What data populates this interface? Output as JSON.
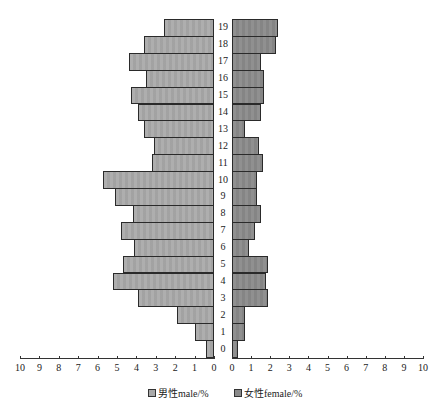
{
  "chart_data": {
    "type": "bar",
    "orientation": "horizontal",
    "subtype": "population-pyramid",
    "title": "",
    "categories": [
      "0",
      "1",
      "2",
      "3",
      "4",
      "5",
      "6",
      "7",
      "8",
      "9",
      "10",
      "11",
      "12",
      "13",
      "14",
      "15",
      "16",
      "17",
      "18",
      "19"
    ],
    "series": [
      {
        "name": "男性male/%",
        "side": "left",
        "color": "#a9a9a9",
        "values": [
          0.4,
          1.0,
          1.9,
          3.9,
          5.2,
          4.7,
          4.1,
          4.8,
          4.2,
          5.1,
          5.7,
          3.2,
          3.1,
          3.6,
          3.9,
          4.3,
          3.5,
          4.4,
          3.6,
          2.6
        ]
      },
      {
        "name": "女性female/%",
        "side": "right",
        "color": "#8a8a8a",
        "values": [
          0.3,
          0.7,
          0.7,
          1.9,
          1.8,
          1.9,
          0.9,
          1.2,
          1.5,
          1.3,
          1.3,
          1.6,
          1.4,
          0.7,
          1.5,
          1.7,
          1.7,
          1.5,
          2.3,
          2.4
        ]
      }
    ],
    "x_ticks_left": [
      "10",
      "9",
      "8",
      "7",
      "6",
      "5",
      "4",
      "3",
      "2",
      "1",
      "0"
    ],
    "x_ticks_right": [
      "0",
      "1",
      "2",
      "3",
      "4",
      "5",
      "6",
      "7",
      "8",
      "9",
      "10"
    ],
    "xlim": [
      0,
      10
    ],
    "xlabel": "",
    "ylabel": "",
    "grid": false,
    "legend_position": "bottom"
  },
  "legend": {
    "male": "男性male/%",
    "female": "女性female/%"
  }
}
